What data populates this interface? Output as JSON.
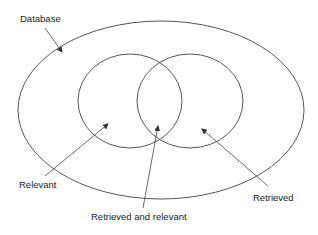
{
  "diagram": {
    "type": "venn",
    "labels": {
      "database": "Database",
      "relevant": "Relevant",
      "retrieved_and_relevant": "Retrieved and relevant",
      "retrieved": "Retrieved"
    },
    "colors": {
      "stroke": "#555555",
      "text": "#222222",
      "background": "#ffffff"
    }
  }
}
